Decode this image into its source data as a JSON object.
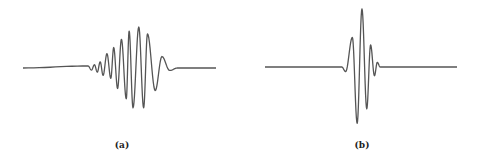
{
  "chart_data": [
    {
      "type": "line",
      "title": "",
      "caption": "(a)",
      "xlabel": "",
      "ylabel": "",
      "grid": false,
      "legend": "none",
      "color": "#555555",
      "description": "Modulated wave packet with Gaussian-like envelope, skewed; slow ripple onset on left, decay tail on right",
      "xlim": [
        0,
        1
      ],
      "ylim": [
        -1,
        1
      ],
      "extrema": [
        {
          "x": 0.337,
          "y": 0.05
        },
        {
          "x": 0.355,
          "y": -0.05
        },
        {
          "x": 0.37,
          "y": 0.08
        },
        {
          "x": 0.385,
          "y": -0.1
        },
        {
          "x": 0.4,
          "y": 0.15
        },
        {
          "x": 0.415,
          "y": -0.18
        },
        {
          "x": 0.435,
          "y": 0.35
        },
        {
          "x": 0.455,
          "y": -0.25
        },
        {
          "x": 0.47,
          "y": 0.5
        },
        {
          "x": 0.49,
          "y": -0.5
        },
        {
          "x": 0.51,
          "y": 0.7
        },
        {
          "x": 0.535,
          "y": -0.75
        },
        {
          "x": 0.55,
          "y": 0.9
        },
        {
          "x": 0.57,
          "y": -0.97
        },
        {
          "x": 0.6,
          "y": 1.0
        },
        {
          "x": 0.625,
          "y": -0.97
        },
        {
          "x": 0.645,
          "y": 0.83
        },
        {
          "x": 0.685,
          "y": -0.55
        },
        {
          "x": 0.72,
          "y": 0.28
        },
        {
          "x": 0.76,
          "y": -0.06
        },
        {
          "x": 0.8,
          "y": 0.0
        }
      ]
    },
    {
      "type": "line",
      "title": "",
      "caption": "(b)",
      "xlabel": "",
      "ylabel": "",
      "grid": false,
      "legend": "none",
      "color": "#555555",
      "description": "Compact wavelet with few oscillations, largest peak near center",
      "xlim": [
        0,
        1
      ],
      "ylim": [
        -1,
        1
      ],
      "extrema": [
        {
          "x": 0.4,
          "y": 0.0
        },
        {
          "x": 0.42,
          "y": -0.08
        },
        {
          "x": 0.455,
          "y": 0.51
        },
        {
          "x": 0.48,
          "y": -0.97
        },
        {
          "x": 0.505,
          "y": 1.0
        },
        {
          "x": 0.53,
          "y": -0.72
        },
        {
          "x": 0.55,
          "y": 0.38
        },
        {
          "x": 0.57,
          "y": -0.15
        },
        {
          "x": 0.585,
          "y": 0.08
        },
        {
          "x": 0.6,
          "y": 0.0
        }
      ]
    }
  ]
}
